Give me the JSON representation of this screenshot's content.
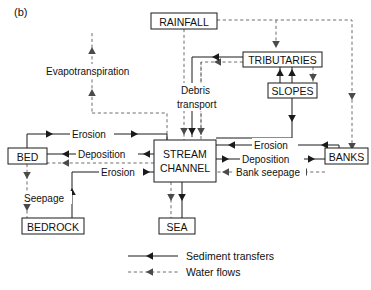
{
  "figure": {
    "panel_label": "(b)",
    "caption_partial": ""
  },
  "nodes": [
    {
      "id": "rainfall",
      "label": "RAINFALL",
      "x": 151,
      "y": 13,
      "w": 66,
      "h": 16
    },
    {
      "id": "tributaries",
      "label": "TRIBUTARIES",
      "x": 243,
      "y": 52,
      "w": 79,
      "h": 15
    },
    {
      "id": "slopes",
      "label": "SLOPES",
      "x": 268,
      "y": 83,
      "w": 49,
      "h": 15
    },
    {
      "id": "bed",
      "label": "BED",
      "x": 8,
      "y": 148,
      "w": 39,
      "h": 16
    },
    {
      "id": "stream",
      "label1": "STREAM",
      "label2": "CHANNEL",
      "x": 154,
      "y": 140,
      "w": 62,
      "h": 42
    },
    {
      "id": "banks",
      "label": "BANKS",
      "x": 325,
      "y": 148,
      "w": 43,
      "h": 16
    },
    {
      "id": "bedrock",
      "label": "BEDROCK",
      "x": 22,
      "y": 218,
      "w": 62,
      "h": 16
    },
    {
      "id": "sea",
      "label": "SEA",
      "x": 159,
      "y": 218,
      "w": 36,
      "h": 16
    }
  ],
  "flow_labels": {
    "evapotranspiration": "Evapotranspiration",
    "debris_transport_l1": "Debris",
    "debris_transport_l2": "transport",
    "erosion_bed_top": "Erosion",
    "deposition_bed": "Deposition",
    "erosion_bedrock": "Erosion",
    "seepage": "Seepage",
    "erosion_banks": "Erosion",
    "deposition_banks": "Deposition",
    "bank_seepage": "Bank seepage"
  },
  "legend": {
    "items": [
      {
        "id": "sediment",
        "label": "Sediment transfers",
        "style": "solid"
      },
      {
        "id": "water",
        "label": "Water flows",
        "style": "dashed"
      }
    ]
  },
  "colors": {
    "ink": "#1a1a1a",
    "dashed": "#6f6f6f",
    "background": "#ffffff",
    "caption": "#b9b9b9"
  }
}
